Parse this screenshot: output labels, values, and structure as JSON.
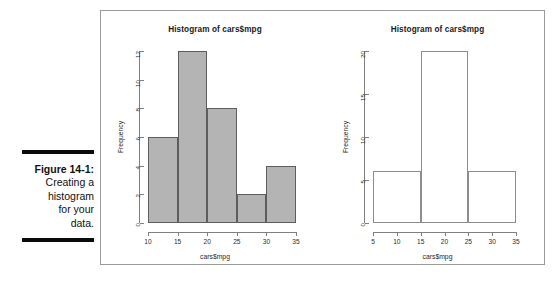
{
  "caption": {
    "label": "Figure 14-1:",
    "line1": "Creating a",
    "line2": "histogram",
    "line3": "for your",
    "line4": "data."
  },
  "colors": {
    "bar_fill": "#b4b4b4",
    "bar_border": "#5d5d5d",
    "open_bar_border": "#8d8d8d",
    "axis": "#808080",
    "frame": "#9a9a9a",
    "rule": "#0a0a0a"
  },
  "chart_data": [
    {
      "type": "bar",
      "title": "Histogram of cars$mpg",
      "xlabel": "cars$mpg",
      "ylabel": "Frequency",
      "bin_width": 5,
      "bin_edges": [
        10,
        15,
        20,
        25,
        30,
        35
      ],
      "categories": [
        "10-15",
        "15-20",
        "20-25",
        "25-30",
        "30-35"
      ],
      "values": [
        6,
        12,
        8,
        2,
        4
      ],
      "xlim": [
        10,
        35
      ],
      "ylim": [
        0,
        12
      ],
      "xticks": [
        10,
        15,
        20,
        25,
        30,
        35
      ],
      "yticks": [
        0,
        2,
        4,
        6,
        8,
        10,
        12
      ],
      "grid": false,
      "legend": false,
      "fill": "gray"
    },
    {
      "type": "bar",
      "title": "Histogram of cars$mpg",
      "xlabel": "cars$mpg",
      "ylabel": "Frequency",
      "bin_width": 10,
      "bin_edges": [
        5,
        15,
        25,
        35
      ],
      "categories": [
        "5-15",
        "15-25",
        "25-35"
      ],
      "values": [
        6,
        20,
        6
      ],
      "xlim": [
        5,
        35
      ],
      "ylim": [
        0,
        20
      ],
      "xticks": [
        5,
        10,
        15,
        20,
        25,
        30,
        35
      ],
      "yticks": [
        0,
        5,
        10,
        15,
        20
      ],
      "grid": false,
      "legend": false,
      "fill": "none"
    }
  ]
}
